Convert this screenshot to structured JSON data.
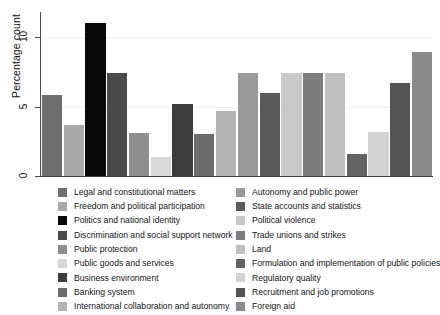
{
  "chart_data": {
    "type": "bar",
    "title": "",
    "xlabel": "",
    "ylabel": "Percentage count",
    "ylim": [
      0,
      11.8
    ],
    "yticks": [
      0,
      5,
      10
    ],
    "ytick_labels": [
      "0",
      "5",
      "10"
    ],
    "grid": true,
    "legend_position": "bottom",
    "categories": [
      "Legal and constitutional matters",
      "Freedom and political participation",
      "Politics and national identity",
      "Discrimination and social support network",
      "Public protection",
      "Public goods and services",
      "Business environment",
      "Banking system",
      "International collaboration and autonomy",
      "Autonomy and public power",
      "State accounts and statistics",
      "Political violence",
      "Trade unions and strikes",
      "Land",
      "Formulation and implementation of public policies",
      "Regulatory quality",
      "Recruitment and job promotions",
      "Foreign aid"
    ],
    "values": [
      5.8,
      3.7,
      11.0,
      7.4,
      3.1,
      1.4,
      5.2,
      3.0,
      4.7,
      7.4,
      6.0,
      7.4,
      7.4,
      7.4,
      1.6,
      3.2,
      6.7,
      8.9
    ],
    "colors": [
      "#6f6f6f",
      "#a9a9a9",
      "#0a0a0a",
      "#4a4a4a",
      "#8e8e8e",
      "#d8d8d8",
      "#3c3c3c",
      "#6b6b6b",
      "#b4b4b4",
      "#9a9a9a",
      "#5a5a5a",
      "#c9c9c9",
      "#7d7d7d",
      "#bfbfbf",
      "#636363",
      "#d2d2d2",
      "#555555",
      "#8a8a8a"
    ]
  },
  "legend": {
    "left_column": [
      {
        "label": "Legal and constitutional matters",
        "color": "#6f6f6f"
      },
      {
        "label": "Freedom and political participation",
        "color": "#a9a9a9"
      },
      {
        "label": "Politics and national identity",
        "color": "#0a0a0a"
      },
      {
        "label": "Discrimination and social support network",
        "color": "#4a4a4a"
      },
      {
        "label": "Public protection",
        "color": "#8e8e8e"
      },
      {
        "label": "Public goods and services",
        "color": "#d8d8d8"
      },
      {
        "label": "Business environment",
        "color": "#3c3c3c"
      },
      {
        "label": "Banking system",
        "color": "#6b6b6b"
      },
      {
        "label": "International collaboration and autonomy",
        "color": "#b4b4b4"
      }
    ],
    "right_column": [
      {
        "label": "Autonomy and public power",
        "color": "#9a9a9a"
      },
      {
        "label": "State accounts and statistics",
        "color": "#5a5a5a"
      },
      {
        "label": "Political violence",
        "color": "#c9c9c9"
      },
      {
        "label": "Trade unions and strikes",
        "color": "#7d7d7d"
      },
      {
        "label": "Land",
        "color": "#bfbfbf"
      },
      {
        "label": "Formulation and implementation of public policies",
        "color": "#636363"
      },
      {
        "label": "Regulatory quality",
        "color": "#d2d2d2"
      },
      {
        "label": "Recruitment and job promotions",
        "color": "#555555"
      },
      {
        "label": "Foreign aid",
        "color": "#8a8a8a"
      }
    ]
  }
}
